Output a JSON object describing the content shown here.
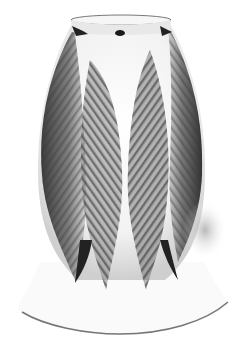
{
  "image": {
    "subject": "Art glass lamp shade with pulled-feather decoration",
    "alt": "Grayscale photo of a tulip-shaped glass lamp shade with dark feather patterns",
    "colors": {
      "background": "#ffffff",
      "glass": "#f4f4f4",
      "feather_dark": "#2a2a2a",
      "feather_mid": "#777777",
      "shadow": "#bdbdbd"
    }
  }
}
